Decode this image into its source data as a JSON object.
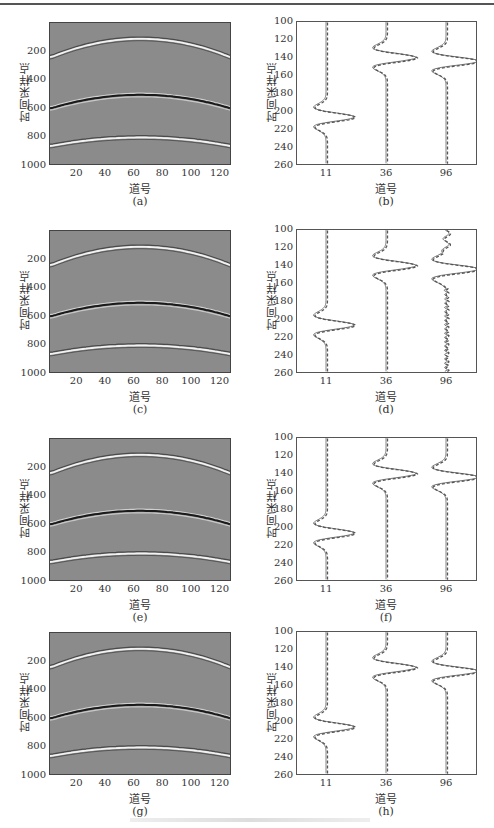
{
  "figure": {
    "panels": [
      {
        "id": "a",
        "caption": "(a)",
        "type": "seismic",
        "xlabel": "道号",
        "ylabel": "时间采样点"
      },
      {
        "id": "b",
        "caption": "(b)",
        "type": "traces",
        "xlabel": "道号",
        "ylabel": "时间采样点"
      },
      {
        "id": "c",
        "caption": "(c)",
        "type": "seismic",
        "xlabel": "道号",
        "ylabel": "时间采样点"
      },
      {
        "id": "d",
        "caption": "(d)",
        "type": "traces",
        "xlabel": "道号",
        "ylabel": "时间采样点"
      },
      {
        "id": "e",
        "caption": "(e)",
        "type": "seismic",
        "xlabel": "道号",
        "ylabel": "时间采样点"
      },
      {
        "id": "f",
        "caption": "(f)",
        "type": "traces",
        "xlabel": "道号",
        "ylabel": "时间采样点"
      },
      {
        "id": "g",
        "caption": "(g)",
        "type": "seismic",
        "xlabel": "道号",
        "ylabel": "时间采样点"
      },
      {
        "id": "h",
        "caption": "(h)",
        "type": "traces",
        "xlabel": "道号",
        "ylabel": "时间采样点"
      }
    ],
    "seismic_yticks": [
      "200",
      "400",
      "600",
      "800",
      "1000"
    ],
    "seismic_xticks": [
      "20",
      "40",
      "60",
      "80",
      "100",
      "120"
    ],
    "trace_yticks": [
      "100",
      "120",
      "140",
      "160",
      "180",
      "200",
      "220",
      "240",
      "260"
    ],
    "trace_xticks": [
      "11",
      "36",
      "96"
    ]
  },
  "chart_data": [
    {
      "panel": "a",
      "type": "heatmap",
      "title": "",
      "xlabel": "道号",
      "ylabel": "时间采样点",
      "xlim": [
        1,
        128
      ],
      "ylim": [
        1000,
        0
      ],
      "xticks": [
        20,
        40,
        60,
        80,
        100,
        120
      ],
      "yticks": [
        200,
        400,
        600,
        800,
        1000
      ],
      "events": [
        {
          "apex_trace": 65,
          "apex_time": 110,
          "edge_time": 240,
          "polarity": "positive"
        },
        {
          "apex_trace": 65,
          "apex_time": 505,
          "edge_time": 600,
          "polarity": "negative"
        },
        {
          "apex_trace": 65,
          "apex_time": 810,
          "edge_time": 870,
          "polarity": "positive"
        }
      ]
    },
    {
      "panel": "b",
      "type": "line",
      "xlabel": "道号",
      "ylabel": "时间采样点",
      "ylim": [
        260,
        100
      ],
      "categories": [
        "11",
        "36",
        "96"
      ],
      "series": [
        {
          "name": "solid",
          "style": "solid"
        },
        {
          "name": "dashed",
          "style": "dashed"
        }
      ],
      "wavelets": [
        {
          "trace": "11",
          "center": 207
        },
        {
          "trace": "36",
          "center": 140
        },
        {
          "trace": "96",
          "center": 144
        }
      ]
    },
    {
      "panel": "c",
      "type": "heatmap",
      "xlabel": "道号",
      "ylabel": "时间采样点",
      "xlim": [
        1,
        128
      ],
      "ylim": [
        1000,
        0
      ]
    },
    {
      "panel": "d",
      "type": "line",
      "xlabel": "道号",
      "ylabel": "时间采样点",
      "ylim": [
        260,
        100
      ],
      "categories": [
        "11",
        "36",
        "96"
      ],
      "note": "trace 96 noisy"
    },
    {
      "panel": "e",
      "type": "heatmap",
      "xlabel": "道号",
      "ylabel": "时间采样点",
      "xlim": [
        1,
        128
      ],
      "ylim": [
        1000,
        0
      ]
    },
    {
      "panel": "f",
      "type": "line",
      "xlabel": "道号",
      "ylabel": "时间采样点",
      "ylim": [
        260,
        100
      ],
      "categories": [
        "11",
        "36",
        "96"
      ]
    },
    {
      "panel": "g",
      "type": "heatmap",
      "xlabel": "道号",
      "ylabel": "时间采样点",
      "xlim": [
        1,
        128
      ],
      "ylim": [
        1000,
        0
      ]
    },
    {
      "panel": "h",
      "type": "line",
      "xlabel": "道号",
      "ylabel": "时间采样点",
      "ylim": [
        260,
        100
      ],
      "categories": [
        "11",
        "36",
        "96"
      ]
    }
  ]
}
